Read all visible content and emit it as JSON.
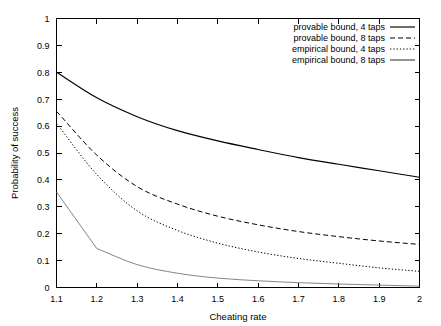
{
  "chart_data": {
    "type": "line",
    "title": "",
    "xlabel": "Cheating rate",
    "ylabel": "Probability of success",
    "xlim": [
      1.1,
      2.0
    ],
    "ylim": [
      0,
      1
    ],
    "grid": false,
    "legend_position": "top-right-inside",
    "xticks": [
      "1.1",
      "1.2",
      "1.3",
      "1.4",
      "1.5",
      "1.6",
      "1.7",
      "1.8",
      "1.9",
      "2"
    ],
    "xtick_values": [
      1.1,
      1.2,
      1.3,
      1.4,
      1.5,
      1.6,
      1.7,
      1.8,
      1.9,
      2.0
    ],
    "yticks": [
      "0",
      "0.1",
      "0.2",
      "0.3",
      "0.4",
      "0.5",
      "0.6",
      "0.7",
      "0.8",
      "0.9",
      "1"
    ],
    "ytick_values": [
      0,
      0.1,
      0.2,
      0.3,
      0.4,
      0.5,
      0.6,
      0.7,
      0.8,
      0.9,
      1.0
    ],
    "x": [
      1.1,
      1.2,
      1.3,
      1.4,
      1.5,
      1.6,
      1.7,
      1.8,
      1.9,
      2.0
    ],
    "series": [
      {
        "name": "provable bound, 4 taps",
        "style": "solid",
        "color": "#000000",
        "values": [
          0.8,
          0.705,
          0.635,
          0.583,
          0.545,
          0.513,
          0.483,
          0.458,
          0.434,
          0.41
        ]
      },
      {
        "name": "provable bound, 8 taps",
        "style": "dashed",
        "color": "#000000",
        "values": [
          0.655,
          0.492,
          0.375,
          0.31,
          0.265,
          0.233,
          0.208,
          0.189,
          0.173,
          0.16
        ]
      },
      {
        "name": "empirical bound, 4 taps",
        "style": "dotted",
        "color": "#000000",
        "values": [
          0.61,
          0.42,
          0.285,
          0.212,
          0.165,
          0.132,
          0.108,
          0.09,
          0.073,
          0.06
        ]
      },
      {
        "name": "empirical bound, 8 taps",
        "style": "thin-solid",
        "color": "#6f6f6f",
        "values": [
          0.355,
          0.145,
          0.085,
          0.053,
          0.035,
          0.025,
          0.018,
          0.013,
          0.009,
          0.005
        ]
      }
    ]
  },
  "legend": {
    "entries": [
      {
        "label": "provable bound, 4 taps"
      },
      {
        "label": "provable bound, 8 taps"
      },
      {
        "label": "empirical bound, 4 taps"
      },
      {
        "label": "empirical bound, 8 taps"
      }
    ]
  }
}
